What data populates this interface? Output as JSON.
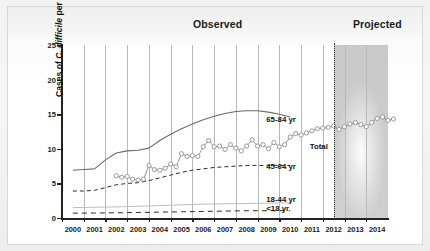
{
  "figure": {
    "bands": {
      "observed": "Observed",
      "projected": "Projected"
    },
    "colors": {
      "line_65_84": "#6b6b6b",
      "line_45_64": "#2b2b2b",
      "line_18_44": "#bdbdbd",
      "line_under18": "#2b2b2b",
      "total_marker": "#8a8a8a",
      "axis": "#222222",
      "grid": "#b9b9b9",
      "projected_shade": "#cccccc",
      "divider": "#2a2a2a"
    }
  },
  "chart_data": {
    "type": "line",
    "title": "",
    "xlabel": "",
    "ylabel": "Cases of C. difficile per 1000 Discharges",
    "ylabel_parts": {
      "pre": "Cases of ",
      "italic": "C. difficile",
      "post": " per 1000 Discharges"
    },
    "ylim": [
      0,
      25
    ],
    "yticks": [
      0,
      5,
      10,
      15,
      20,
      25
    ],
    "xlim": [
      2000,
      2015
    ],
    "xticks": [
      2000,
      2001,
      2002,
      2003,
      2004,
      2005,
      2006,
      2007,
      2008,
      2009,
      2010,
      2011,
      2012,
      2013,
      2014
    ],
    "grid": "vertical",
    "legend_position": "inline-right",
    "annotations": [
      {
        "text": "Observed",
        "x": 2006.0,
        "region": "header"
      },
      {
        "text": "Projected",
        "x": 2013.6,
        "region": "header"
      },
      {
        "text": "65-84 yr",
        "x": 2009.4,
        "y": 14.2
      },
      {
        "text": "Total",
        "x": 2011.4,
        "y": 10.2
      },
      {
        "text": "45-64 yr",
        "x": 2009.4,
        "y": 7.3
      },
      {
        "text": "18-44 yr",
        "x": 2009.4,
        "y": 2.6
      },
      {
        "text": "<18 yr",
        "x": 2009.4,
        "y": 1.3
      }
    ],
    "projection_start": 2012.5,
    "series": [
      {
        "name": "65-84 yr",
        "style": "solid",
        "x": [
          2000,
          2000.5,
          2001,
          2001.5,
          2002,
          2002.5,
          2003,
          2003.5,
          2004,
          2004.5,
          2005,
          2005.5,
          2006,
          2006.5,
          2007,
          2007.5,
          2008,
          2008.5,
          2009,
          2009.5,
          2010
        ],
        "values": [
          6.9,
          7.0,
          7.1,
          8.4,
          9.4,
          9.7,
          9.8,
          10.1,
          11.2,
          12.1,
          12.9,
          13.6,
          14.2,
          14.7,
          15.1,
          15.4,
          15.5,
          15.5,
          15.3,
          15.0,
          14.6
        ]
      },
      {
        "name": "45-64 yr",
        "style": "dashed",
        "x": [
          2000,
          2000.5,
          2001,
          2001.5,
          2002,
          2002.5,
          2003,
          2003.5,
          2004,
          2004.5,
          2005,
          2005.5,
          2006,
          2006.5,
          2007,
          2007.5,
          2008,
          2008.5,
          2009,
          2009.5,
          2010
        ],
        "values": [
          3.9,
          3.9,
          4.0,
          4.4,
          4.8,
          5.0,
          5.1,
          5.4,
          5.8,
          6.2,
          6.6,
          6.9,
          7.1,
          7.3,
          7.4,
          7.5,
          7.6,
          7.6,
          7.6,
          7.6,
          7.6
        ]
      },
      {
        "name": "18-44 yr",
        "style": "solid-light",
        "x": [
          2000,
          2001,
          2002,
          2003,
          2004,
          2005,
          2006,
          2007,
          2008,
          2009,
          2010
        ],
        "values": [
          1.5,
          1.55,
          1.6,
          1.7,
          1.8,
          1.9,
          2.0,
          2.05,
          2.1,
          2.15,
          2.2
        ]
      },
      {
        "name": "<18 yr",
        "style": "dashed",
        "x": [
          2000,
          2001,
          2002,
          2003,
          2004,
          2005,
          2006,
          2007,
          2008,
          2009,
          2010
        ],
        "values": [
          0.7,
          0.72,
          0.75,
          0.8,
          0.85,
          0.9,
          0.95,
          1.0,
          1.05,
          1.05,
          1.05
        ]
      },
      {
        "name": "Total",
        "style": "markers",
        "x": [
          2002.0,
          2002.25,
          2002.5,
          2002.75,
          2003.0,
          2003.25,
          2003.5,
          2003.75,
          2004.0,
          2004.25,
          2004.5,
          2004.75,
          2005.0,
          2005.25,
          2005.5,
          2005.75,
          2006.0,
          2006.25,
          2006.5,
          2006.75,
          2007.0,
          2007.25,
          2007.5,
          2007.75,
          2008.0,
          2008.25,
          2008.5,
          2008.75,
          2009.0,
          2009.25,
          2009.5,
          2009.75,
          2010.0,
          2010.25,
          2010.5,
          2010.75,
          2011.0,
          2011.25,
          2011.5,
          2011.75,
          2012.0,
          2012.25,
          2012.5,
          2012.75,
          2013.0,
          2013.25,
          2013.5,
          2013.75,
          2014.0,
          2014.25,
          2014.5,
          2014.75
        ],
        "values": [
          6.1,
          5.9,
          6.0,
          5.6,
          5.5,
          5.6,
          7.6,
          7.0,
          6.9,
          7.2,
          7.8,
          7.4,
          9.3,
          8.9,
          9.0,
          8.9,
          10.3,
          11.2,
          10.3,
          10.4,
          9.9,
          10.6,
          10.1,
          9.7,
          10.4,
          11.3,
          10.4,
          10.6,
          10.0,
          10.9,
          10.3,
          10.6,
          11.7,
          12.2,
          12.0,
          12.3,
          12.6,
          12.9,
          13.0,
          13.1,
          13.3,
          12.8,
          13.2,
          13.6,
          13.8,
          13.5,
          13.2,
          13.8,
          14.4,
          14.6,
          14.1,
          14.3
        ]
      }
    ]
  }
}
